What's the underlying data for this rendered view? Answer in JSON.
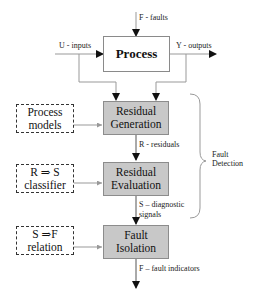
{
  "diagram": {
    "process": {
      "label": "Process"
    },
    "signals": {
      "faults_in": "F - faults",
      "inputs": "U - inputs",
      "outputs": "Y - outputs",
      "residuals": "R - residuals",
      "diagnostic_line1": "S – diagnostic",
      "diagnostic_line2": "signals",
      "fault_indicators": "F – fault indicators"
    },
    "stages": [
      {
        "line1": "Residual",
        "line2": "Generation"
      },
      {
        "line1": "Residual",
        "line2": "Evaluation"
      },
      {
        "line1": "Fault",
        "line2": "Isolation"
      }
    ],
    "aux_inputs": [
      {
        "line1": "Process",
        "line2": "models"
      },
      {
        "line1": "R ⇒ S",
        "line2": "classifier"
      },
      {
        "line1": "S ⇒F",
        "line2": "relation"
      }
    ],
    "brace_label": {
      "line1": "Fault",
      "line2": "Detection"
    },
    "colors": {
      "stage_fill": "#c8c8c8",
      "line": "#999999",
      "arrow": "#111111"
    }
  }
}
